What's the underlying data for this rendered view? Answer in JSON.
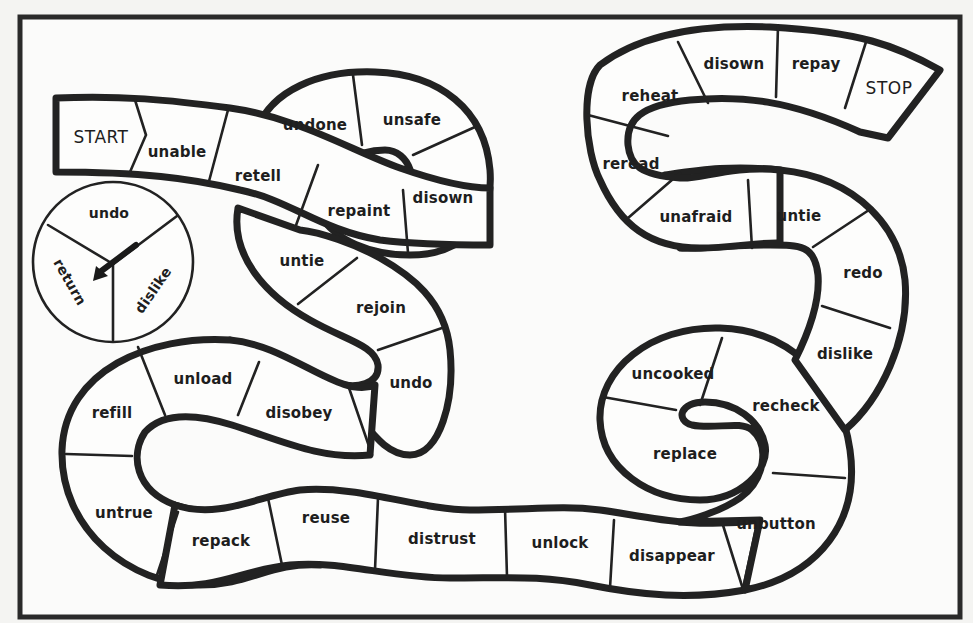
{
  "board": {
    "title": "Prefix board game",
    "start_label": "START",
    "stop_label": "STOP",
    "colors": {
      "background": "#fbfbfa",
      "ink": "#222222",
      "space_fill": "#fdfdfc"
    }
  },
  "spinner": {
    "sections": [
      {
        "label": "undo"
      },
      {
        "label": "dislike"
      },
      {
        "label": "return"
      }
    ],
    "arrow_direction": "down-left"
  },
  "spaces": [
    {
      "index": 0,
      "label": "START"
    },
    {
      "index": 1,
      "label": "unable"
    },
    {
      "index": 2,
      "label": "retell"
    },
    {
      "index": 3,
      "label": "undone"
    },
    {
      "index": 4,
      "label": "unsafe"
    },
    {
      "index": 5,
      "label": "disown"
    },
    {
      "index": 6,
      "label": "repaint"
    },
    {
      "index": 7,
      "label": "untie"
    },
    {
      "index": 8,
      "label": "rejoin"
    },
    {
      "index": 9,
      "label": "undo"
    },
    {
      "index": 10,
      "label": "disobey"
    },
    {
      "index": 11,
      "label": "unload"
    },
    {
      "index": 12,
      "label": "refill"
    },
    {
      "index": 13,
      "label": "untrue"
    },
    {
      "index": 14,
      "label": "repack"
    },
    {
      "index": 15,
      "label": "reuse"
    },
    {
      "index": 16,
      "label": "distrust"
    },
    {
      "index": 17,
      "label": "unlock"
    },
    {
      "index": 18,
      "label": "disappear"
    },
    {
      "index": 19,
      "label": "unbutton"
    },
    {
      "index": 20,
      "label": "replace"
    },
    {
      "index": 21,
      "label": "uncooked"
    },
    {
      "index": 22,
      "label": "recheck"
    },
    {
      "index": 23,
      "label": "dislike"
    },
    {
      "index": 24,
      "label": "redo"
    },
    {
      "index": 25,
      "label": "untie"
    },
    {
      "index": 26,
      "label": "unafraid"
    },
    {
      "index": 27,
      "label": "reread"
    },
    {
      "index": 28,
      "label": "reheat"
    },
    {
      "index": 29,
      "label": "disown"
    },
    {
      "index": 30,
      "label": "repay"
    },
    {
      "index": 31,
      "label": "STOP"
    }
  ]
}
